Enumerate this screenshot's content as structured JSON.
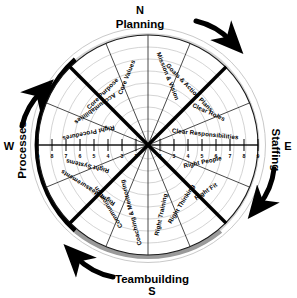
{
  "diagram": {
    "type": "radar-wheel",
    "center": {
      "x": 148,
      "y": 145
    },
    "radius_outer": 118,
    "radius_inner": 18,
    "compass": [
      {
        "id": "north",
        "letter": "N",
        "theme": "Planning",
        "position": "top"
      },
      {
        "id": "east",
        "letter": "E",
        "theme": "Staffing",
        "position": "right"
      },
      {
        "id": "south",
        "letter": "S",
        "theme": "Teambuilding",
        "position": "bottom"
      },
      {
        "id": "west",
        "letter": "W",
        "theme": "Processes",
        "position": "left"
      }
    ],
    "scale": {
      "ticks_left": [
        "9",
        "8",
        "7",
        "6",
        "5",
        "4",
        "3",
        "2"
      ],
      "ticks_right": [
        "2",
        "3",
        "4",
        "5",
        "6",
        "7",
        "8",
        "9"
      ],
      "min": 1,
      "max": 9,
      "rings": 8
    },
    "segments": [
      {
        "index": 0,
        "label": "Mission & Vision",
        "quadrant": "Planning"
      },
      {
        "index": 1,
        "label": "Goals & Action Plans",
        "quadrant": "Planning"
      },
      {
        "index": 2,
        "label": "Clear Roles",
        "quadrant": "Staffing"
      },
      {
        "index": 3,
        "label": "Clear Responsibilities",
        "quadrant": "Staffing"
      },
      {
        "index": 4,
        "label": "Right People",
        "quadrant": "Staffing"
      },
      {
        "index": 5,
        "label": "Right Fit",
        "quadrant": "Staffing"
      },
      {
        "index": 6,
        "label": "Right Thinking",
        "quadrant": "Teambuilding"
      },
      {
        "index": 7,
        "label": "Right Training",
        "quadrant": "Teambuilding"
      },
      {
        "index": 8,
        "label": "Coaching & Mentoring",
        "quadrant": "Teambuilding"
      },
      {
        "index": 9,
        "label": "Communication",
        "quadrant": "Teambuilding"
      },
      {
        "index": 10,
        "label": "Right Measurements",
        "quadrant": "Processes"
      },
      {
        "index": 11,
        "label": "Right Systems",
        "quadrant": "Processes"
      },
      {
        "index": 12,
        "label": "Right Procedures",
        "quadrant": "Processes"
      },
      {
        "index": 13,
        "label": "Accountabilities",
        "quadrant": "Processes"
      },
      {
        "index": 14,
        "label": "Core Purpose",
        "quadrant": "Planning"
      },
      {
        "index": 15,
        "label": "Core Values",
        "quadrant": "Planning"
      }
    ],
    "arcs": [
      {
        "id": "processes-arc",
        "color": "#000000",
        "weight": "thick"
      },
      {
        "id": "teambuilding-arc",
        "color": "#9a9a9a",
        "weight": "thick"
      },
      {
        "id": "planning-arc",
        "color": "#cccccc",
        "weight": "thin"
      },
      {
        "id": "staffing-arc",
        "color": "#cccccc",
        "weight": "thin"
      }
    ],
    "arrows": [
      {
        "id": "planning-arrow",
        "direction": "clockwise-top"
      },
      {
        "id": "staffing-arrow",
        "direction": "clockwise-right"
      },
      {
        "id": "teambuilding-arrow",
        "direction": "clockwise-bottom"
      },
      {
        "id": "processes-arrow",
        "direction": "clockwise-left"
      }
    ],
    "colors": {
      "ink": "#000000",
      "grid": "#b9b9b9",
      "gray_arc": "#9a9a9a",
      "background": "#ffffff"
    }
  }
}
